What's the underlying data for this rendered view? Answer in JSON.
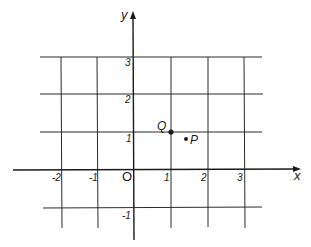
{
  "diagram": {
    "type": "cartesian-grid",
    "colors": {
      "background": "#ffffff",
      "ink": "#1a1a1a",
      "grid": "#2a2a2a"
    },
    "axes": {
      "x_label": "x",
      "y_label": "y",
      "origin_label": "O"
    },
    "x_ticks": [
      {
        "value": -2,
        "label": "-2"
      },
      {
        "value": -1,
        "label": "-1"
      },
      {
        "value": 1,
        "label": "1"
      },
      {
        "value": 2,
        "label": "2"
      },
      {
        "value": 3,
        "label": "3"
      }
    ],
    "y_ticks": [
      {
        "value": 3,
        "label": "3"
      },
      {
        "value": 2,
        "label": "2"
      },
      {
        "value": 1,
        "label": "1"
      },
      {
        "value": -1,
        "label": "-1"
      }
    ],
    "points": [
      {
        "name": "Q",
        "label": "Q",
        "x": 1,
        "y": 1
      },
      {
        "name": "P",
        "label": "P",
        "x": 1.4,
        "y": 0.8
      }
    ]
  }
}
